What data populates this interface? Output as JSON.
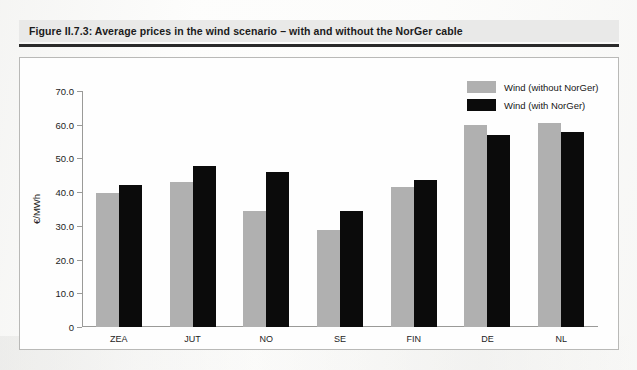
{
  "figure": {
    "title": "Figure II.7.3: Average prices in the wind scenario – with and without the NorGer cable"
  },
  "colors": {
    "series_without": "#b0b0b0",
    "series_with": "#0b0b0b",
    "banner": "#e9e9e8",
    "rule": "#2a2a2a",
    "frame_border": "#b9b9b7",
    "axis": "#9a9a98"
  },
  "chart_data": {
    "type": "bar",
    "title": "Figure II.7.3: Average prices in the wind scenario – with and without the NorGer cable",
    "xlabel": "",
    "ylabel": "€/MWh",
    "ylim": [
      0,
      70
    ],
    "ytick_step": 10,
    "yticks": [
      "0",
      "10.0",
      "20.0",
      "30.0",
      "40.0",
      "50.0",
      "60.0",
      "70.0"
    ],
    "grid": false,
    "legend_position": "top-right",
    "categories": [
      "ZEA",
      "JUT",
      "NO",
      "SE",
      "FIN",
      "DE",
      "NL"
    ],
    "series": [
      {
        "name": "Wind (without NorGer)",
        "color": "#b0b0b0",
        "values": [
          39.8,
          43.0,
          34.4,
          28.8,
          41.5,
          59.9,
          60.5
        ]
      },
      {
        "name": "Wind (with NorGer)",
        "color": "#0b0b0b",
        "values": [
          42.1,
          47.8,
          46.0,
          34.4,
          43.6,
          57.0,
          57.8
        ]
      }
    ]
  }
}
